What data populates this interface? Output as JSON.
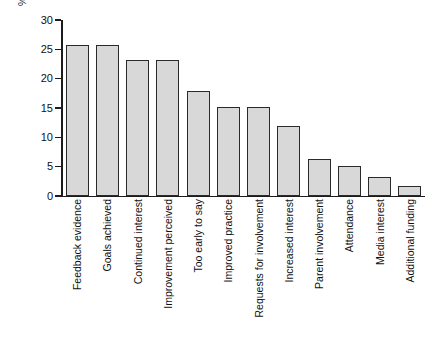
{
  "chart_data": {
    "type": "bar",
    "title": "",
    "subtitle": "",
    "xlabel": "",
    "ylabel": "% of initiatives in survey",
    "ylim": [
      0,
      30
    ],
    "yticks": [
      0,
      5,
      10,
      15,
      20,
      25,
      30
    ],
    "grid": false,
    "legend": null,
    "orientation": "vertical",
    "categories": [
      "Feedback evidence",
      "Goals achieved",
      "Continued interest",
      "Improvement perceived",
      "Too early to say",
      "Improved practice",
      "Requests for involvement",
      "Increased interest",
      "Parent involvement",
      "Attendance",
      "Media interest",
      "Additional funding"
    ],
    "values": [
      25.7,
      25.7,
      23.2,
      23.2,
      17.9,
      15.1,
      15.1,
      12.0,
      6.3,
      5.1,
      3.2,
      1.7
    ],
    "bar_fill_color": "#d8d8d8",
    "bar_edge_color": "#2a2a2a",
    "axis_color": "#1c1c1c",
    "background_color": "#ffffff"
  }
}
